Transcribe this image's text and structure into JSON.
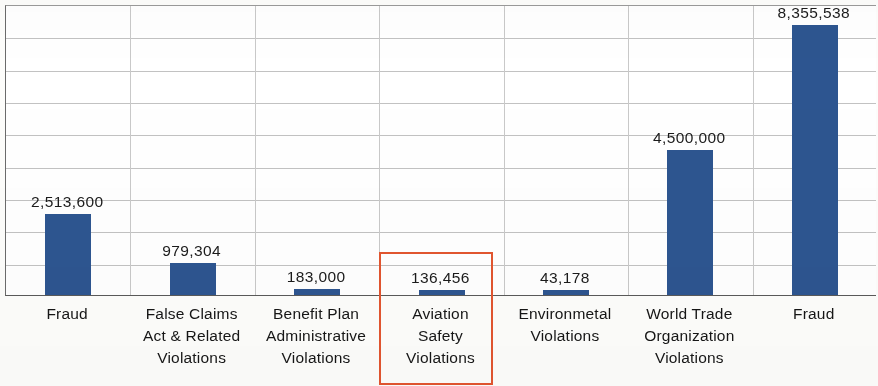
{
  "chart_data": {
    "type": "bar",
    "title": "",
    "subtitle": "",
    "xlabel": "",
    "ylabel": "",
    "grid": true,
    "legend": "none",
    "ylim": [
      0,
      9000000
    ],
    "gridline_step": 1000000,
    "gridline_count": 9,
    "categories": [
      "Fraud",
      "False Claims Act & Related Violations",
      "Benefit Plan Administrative Violations",
      "Aviation Safety Violations",
      "Environmetal Violations",
      "World Trade Organization Violations",
      "Fraud"
    ],
    "values": [
      2513600,
      979304,
      183000,
      136456,
      43178,
      4500000,
      8355538
    ],
    "value_labels": [
      "2,513,600",
      "979,304",
      "183,000",
      "136,456",
      "43,178",
      "4,500,000",
      "8,355,538"
    ],
    "bar_color": "#2d5590",
    "highlight_color": "#e2552f",
    "highlighted_category_index": 3
  },
  "chart": {
    "bars": [
      {
        "id": "bar-fraud-1",
        "label_lines": [
          "Fraud"
        ],
        "value_label": "2,513,600",
        "value": 2513600
      },
      {
        "id": "bar-false-claims-act",
        "label_lines": [
          "False Claims",
          "Act & Related",
          "Violations"
        ],
        "value_label": "979,304",
        "value": 979304
      },
      {
        "id": "bar-benefit-plan",
        "label_lines": [
          "Benefit Plan",
          "Administrative",
          "Violations"
        ],
        "value_label": "183,000",
        "value": 183000
      },
      {
        "id": "bar-aviation-safety",
        "label_lines": [
          "Aviation",
          "Safety",
          "Violations"
        ],
        "value_label": "136,456",
        "value": 136456
      },
      {
        "id": "bar-environmetal",
        "label_lines": [
          "Environmetal",
          "Violations"
        ],
        "value_label": "43,178",
        "value": 43178
      },
      {
        "id": "bar-world-trade-org",
        "label_lines": [
          "World Trade",
          "Organization",
          "Violations"
        ],
        "value_label": "4,500,000",
        "value": 4500000
      },
      {
        "id": "bar-fraud-2",
        "label_lines": [
          "Fraud"
        ],
        "value_label": "8,355,538",
        "value": 8355538
      }
    ]
  }
}
